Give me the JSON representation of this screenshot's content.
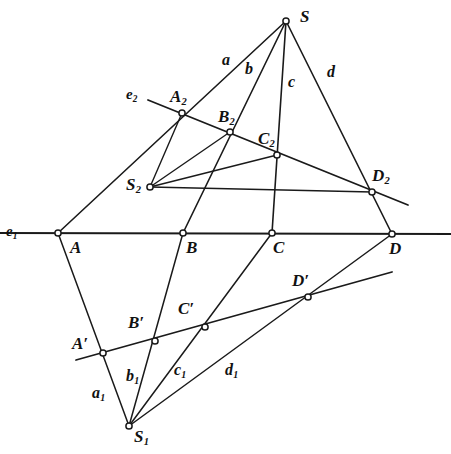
{
  "figure": {
    "stroke_color": "#1a1a1a",
    "background_color": "#ffffff",
    "node_fill": "#ffffff",
    "width": 451,
    "height": 454
  },
  "points": [
    {
      "id": "S",
      "label": "S",
      "sub": "",
      "prime": false,
      "x": 286,
      "y": 21,
      "label_x": 300,
      "label_y": 8,
      "marker": true
    },
    {
      "id": "A2",
      "label": "A",
      "sub": "2",
      "prime": false,
      "x": 182,
      "y": 113,
      "label_x": 170,
      "label_y": 88,
      "marker": true
    },
    {
      "id": "B2",
      "label": "B",
      "sub": "2",
      "prime": false,
      "x": 230,
      "y": 132,
      "label_x": 218,
      "label_y": 108,
      "marker": true
    },
    {
      "id": "C2",
      "label": "C",
      "sub": "2",
      "prime": false,
      "x": 277,
      "y": 155,
      "label_x": 258,
      "label_y": 130,
      "marker": true
    },
    {
      "id": "D2",
      "label": "D",
      "sub": "2",
      "prime": false,
      "x": 372,
      "y": 192,
      "label_x": 372,
      "label_y": 167,
      "marker": true
    },
    {
      "id": "S2",
      "label": "S",
      "sub": "2",
      "prime": false,
      "x": 150,
      "y": 187,
      "label_x": 126,
      "label_y": 176,
      "marker": true
    },
    {
      "id": "A",
      "label": "A",
      "sub": "",
      "prime": false,
      "x": 58,
      "y": 233,
      "label_x": 70,
      "label_y": 239,
      "marker": true
    },
    {
      "id": "B",
      "label": "B",
      "sub": "",
      "prime": false,
      "x": 183,
      "y": 233,
      "label_x": 186,
      "label_y": 239,
      "marker": true
    },
    {
      "id": "C",
      "label": "C",
      "sub": "",
      "prime": false,
      "x": 272,
      "y": 233,
      "label_x": 273,
      "label_y": 239,
      "marker": true
    },
    {
      "id": "D",
      "label": "D",
      "sub": "",
      "prime": false,
      "x": 392,
      "y": 234,
      "label_x": 389,
      "label_y": 240,
      "marker": true
    },
    {
      "id": "Ap",
      "label": "A",
      "sub": "",
      "prime": true,
      "x": 103,
      "y": 353,
      "label_x": 72,
      "label_y": 335,
      "marker": true
    },
    {
      "id": "Bp",
      "label": "B",
      "sub": "",
      "prime": true,
      "x": 155,
      "y": 341,
      "label_x": 128,
      "label_y": 314,
      "marker": true
    },
    {
      "id": "Cp",
      "label": "C",
      "sub": "",
      "prime": true,
      "x": 205,
      "y": 327,
      "label_x": 178,
      "label_y": 300,
      "marker": true
    },
    {
      "id": "Dp",
      "label": "D",
      "sub": "",
      "prime": true,
      "x": 308,
      "y": 297,
      "label_x": 292,
      "label_y": 272,
      "marker": true
    },
    {
      "id": "S1",
      "label": "S",
      "sub": "1",
      "prime": false,
      "x": 129,
      "y": 426,
      "label_x": 134,
      "label_y": 428,
      "marker": true
    }
  ],
  "ray_labels": [
    {
      "id": "a",
      "label": "a",
      "sub": "",
      "x": 222,
      "y": 52
    },
    {
      "id": "b",
      "label": "b",
      "sub": "",
      "x": 245,
      "y": 61
    },
    {
      "id": "c",
      "label": "c",
      "sub": "",
      "x": 288,
      "y": 74
    },
    {
      "id": "d",
      "label": "d",
      "sub": "",
      "x": 327,
      "y": 64
    },
    {
      "id": "a1",
      "label": "a",
      "sub": "1",
      "x": 92,
      "y": 385
    },
    {
      "id": "b1",
      "label": "b",
      "sub": "1",
      "x": 126,
      "y": 368
    },
    {
      "id": "c1",
      "label": "c",
      "sub": "1",
      "x": 174,
      "y": 362
    },
    {
      "id": "d1",
      "label": "d",
      "sub": "1",
      "x": 225,
      "y": 362
    }
  ],
  "axis_labels": [
    {
      "id": "e1",
      "label": "e",
      "sub": "1",
      "x": 6,
      "y": 224
    },
    {
      "id": "e2",
      "label": "e",
      "sub": "2",
      "x": 126,
      "y": 87
    }
  ],
  "lines": [
    {
      "id": "axis-e1",
      "name": "line-e1",
      "x1": 0,
      "y1": 233,
      "x2": 451,
      "y2": 234,
      "width": 1.8
    },
    {
      "id": "axis-e2",
      "name": "line-e2",
      "x1": 148,
      "y1": 100,
      "x2": 408,
      "y2": 205,
      "width": 1.8
    },
    {
      "id": "axis-eprime",
      "name": "line-e-prime",
      "x1": 76,
      "y1": 360,
      "x2": 392,
      "y2": 272,
      "width": 1.8
    },
    {
      "id": "ray-S-a",
      "name": "ray-a-from-S",
      "x1": 286,
      "y1": 21,
      "x2": 58,
      "y2": 233,
      "width": 1.6
    },
    {
      "id": "ray-S-b",
      "name": "ray-b-from-S",
      "x1": 286,
      "y1": 21,
      "x2": 183,
      "y2": 233,
      "width": 1.6
    },
    {
      "id": "ray-S-c",
      "name": "ray-c-from-S",
      "x1": 286,
      "y1": 21,
      "x2": 272,
      "y2": 233,
      "width": 1.6
    },
    {
      "id": "ray-S-d",
      "name": "ray-d-from-S",
      "x1": 286,
      "y1": 21,
      "x2": 392,
      "y2": 234,
      "width": 1.6
    },
    {
      "id": "ray-S2-A2",
      "name": "ray-S2-to-A2",
      "x1": 150,
      "y1": 187,
      "x2": 182,
      "y2": 113,
      "width": 1.4
    },
    {
      "id": "ray-S2-B2",
      "name": "ray-S2-to-B2",
      "x1": 150,
      "y1": 187,
      "x2": 230,
      "y2": 132,
      "width": 1.4
    },
    {
      "id": "ray-S2-C2",
      "name": "ray-S2-to-C2",
      "x1": 150,
      "y1": 187,
      "x2": 277,
      "y2": 155,
      "width": 1.4
    },
    {
      "id": "ray-S2-D2",
      "name": "ray-S2-to-D2",
      "x1": 150,
      "y1": 187,
      "x2": 372,
      "y2": 192,
      "width": 1.4
    },
    {
      "id": "ray-S1-Ap",
      "name": "ray-a1-from-S1",
      "x1": 129,
      "y1": 426,
      "x2": 58,
      "y2": 233,
      "width": 1.5
    },
    {
      "id": "ray-S1-Bp",
      "name": "ray-b1-from-S1",
      "x1": 129,
      "y1": 426,
      "x2": 183,
      "y2": 233,
      "width": 1.5
    },
    {
      "id": "ray-S1-Cp",
      "name": "ray-c1-from-S1",
      "x1": 129,
      "y1": 426,
      "x2": 272,
      "y2": 233,
      "width": 1.5
    },
    {
      "id": "ray-S1-Dp",
      "name": "ray-d1-from-S1",
      "x1": 129,
      "y1": 426,
      "x2": 392,
      "y2": 234,
      "width": 1.5
    }
  ]
}
